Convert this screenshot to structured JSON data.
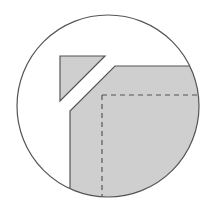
{
  "diagram": {
    "type": "mitered-corner-detail",
    "colors": {
      "background": "#ffffff",
      "outline": "#555555",
      "fill": "#cfcfcf",
      "seam": "#555555"
    },
    "circle": {
      "cx": 108,
      "cy": 106,
      "r": 91
    },
    "cutoff_triangle": {
      "points": "60,56 105,56 60,101"
    },
    "fabric_corner": {
      "points": "115,66 210,66 210,208 70,208 70,111"
    },
    "seam_line_horizontal": {
      "x1": 102,
      "y1": 95,
      "x2": 199,
      "y2": 95
    },
    "seam_line_vertical": {
      "x1": 102,
      "y1": 95,
      "x2": 102,
      "y2": 200
    }
  }
}
